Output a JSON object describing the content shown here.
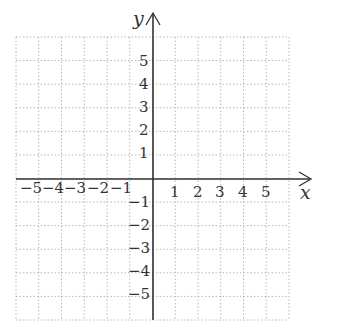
{
  "diagram": {
    "type": "coordinate-plane",
    "x_axis_label": "x",
    "y_axis_label": "y",
    "x_range": [
      -6,
      6
    ],
    "y_range": [
      -6,
      6
    ],
    "grid": "dotted",
    "x_tick_labels": [
      "−5",
      "−4",
      "−3",
      "−2",
      "−1",
      "1",
      "2",
      "3",
      "4",
      "5"
    ],
    "y_tick_labels_positive": [
      "5",
      "4",
      "3",
      "2",
      "1"
    ],
    "y_tick_labels_negative": [
      "−1",
      "−2",
      "−3",
      "−4",
      "−5"
    ],
    "colors": {
      "axis": "#333333",
      "grid": "#b8b8b8",
      "text": "#333333"
    }
  }
}
